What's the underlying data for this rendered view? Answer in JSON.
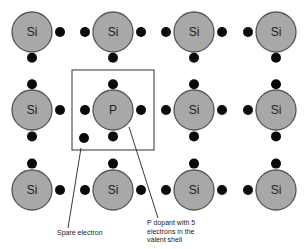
{
  "diagram": {
    "title": "",
    "colors": {
      "atom_fill": "#a8a8a8",
      "atom_stroke": "#555555",
      "electron": "#0a0a0a",
      "text": "#1e1e1e",
      "background": "#ffffff"
    },
    "lattice": {
      "columns_x": [
        32,
        113,
        194,
        276
      ],
      "rows_y": [
        32,
        110,
        190
      ],
      "atom_radius": 20,
      "atoms": [
        {
          "row": 0,
          "col": 0,
          "label": "Si"
        },
        {
          "row": 0,
          "col": 1,
          "label": "Si"
        },
        {
          "row": 0,
          "col": 2,
          "label": "Si"
        },
        {
          "row": 0,
          "col": 3,
          "label": "Si"
        },
        {
          "row": 1,
          "col": 0,
          "label": "Si"
        },
        {
          "row": 1,
          "col": 1,
          "label": "P"
        },
        {
          "row": 1,
          "col": 2,
          "label": "Si"
        },
        {
          "row": 1,
          "col": 3,
          "label": "Si"
        },
        {
          "row": 2,
          "col": 0,
          "label": "Si"
        },
        {
          "row": 2,
          "col": 1,
          "label": "Si"
        },
        {
          "row": 2,
          "col": 2,
          "label": "Si"
        },
        {
          "row": 2,
          "col": 3,
          "label": "Si"
        }
      ]
    },
    "highlight_box": {
      "x": 72,
      "y": 70,
      "width": 82,
      "height": 80
    },
    "spare_electron": {
      "x": 84,
      "y": 138
    },
    "annotations": [
      {
        "id": "spare-electron",
        "text": "Spare electron",
        "line": {
          "x1": 81,
          "y1": 148,
          "x2": 68,
          "y2": 228
        },
        "label_pos": {
          "left": 57,
          "top": 229
        }
      },
      {
        "id": "p-dopant",
        "text": "P dopant with 5\nelectrons in the\nvalent shell",
        "line": {
          "x1": 129,
          "y1": 127,
          "x2": 158,
          "y2": 218
        },
        "label_pos": {
          "left": 147,
          "top": 219
        }
      }
    ]
  }
}
